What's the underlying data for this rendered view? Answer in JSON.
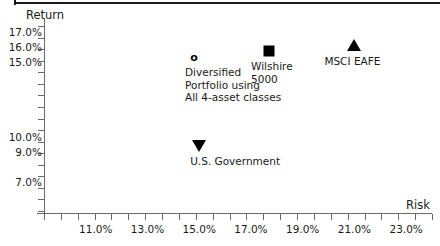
{
  "chart_data": {
    "type": "scatter",
    "title": "",
    "xlabel": "Risk",
    "ylabel": "Return",
    "xlim": [
      9.0,
      24.0
    ],
    "ylim": [
      5.0,
      18.0
    ],
    "grid": false,
    "legend_position": "none",
    "x_ticklabels": [
      "11.0%",
      "13.0%",
      "15.0%",
      "17.0%",
      "19.0%",
      "21.0%",
      "23.0%"
    ],
    "x_ticklabel_values": [
      11.0,
      13.0,
      15.0,
      17.0,
      19.0,
      21.0,
      23.0
    ],
    "x_tick_count": 24,
    "y_ticklabels": [
      "17.0%",
      "16.0%",
      "15.0%",
      "10.0%",
      "9.0%",
      "7.0%"
    ],
    "y_ticklabel_values": [
      17.0,
      16.0,
      15.0,
      10.0,
      9.0,
      7.0
    ],
    "y_tick_count": 17,
    "points": [
      {
        "name": "Diversified Portfolio using All 4-asset classes",
        "label": "Diversified\nPortfolio using\nAll 4-asset classes",
        "marker": "circle-open",
        "x": 14.8,
        "y": 15.4,
        "x_display": "14.8%",
        "y_display": "15.4%"
      },
      {
        "name": "Wilshire 5000",
        "label": "Wilshire\n5000",
        "marker": "square-filled",
        "x": 17.7,
        "y": 15.8,
        "x_display": "17.7%",
        "y_display": "15.8%"
      },
      {
        "name": "MSCI EAFE",
        "label": "MSCI EAFE",
        "marker": "triangle-up",
        "x": 21.0,
        "y": 16.2,
        "x_display": "21.0%",
        "y_display": "16.2%"
      },
      {
        "name": "U.S. Government",
        "label": "U.S. Government",
        "marker": "triangle-down",
        "x": 15.0,
        "y": 9.5,
        "x_display": "15.0%",
        "y_display": "9.5%"
      }
    ]
  },
  "colors": {
    "marker": "#000000",
    "axis": "#6b6b6b",
    "text": "#1a1a1a",
    "rule": "#1a1a1a",
    "background": "#ffffff"
  }
}
